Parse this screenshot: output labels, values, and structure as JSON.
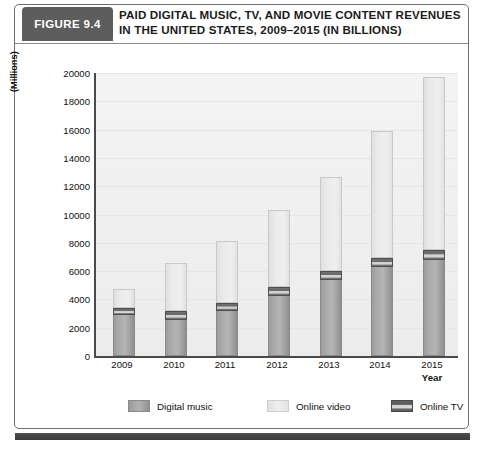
{
  "figure": {
    "tag": "FIGURE 9.4",
    "title_line1": "PAID DIGITAL MUSIC, TV, AND MOVIE CONTENT REVENUES",
    "title_line2": "IN THE UNITED STATES, 2009–2015 (IN BILLIONS)"
  },
  "chart_data": {
    "type": "bar",
    "subtype": "stacked-vertical",
    "title": "PAID DIGITAL MUSIC, TV, AND MOVIE CONTENT REVENUES IN THE UNITED STATES, 2009–2015 (IN BILLIONS)",
    "xlabel": "Year",
    "ylabel": "(Millions)",
    "ylim": [
      0,
      20000
    ],
    "ytick_step": 2000,
    "yticks": [
      "20000",
      "18000",
      "16000",
      "14000",
      "12000",
      "10000",
      "8000",
      "6000",
      "4000",
      "2000",
      "0"
    ],
    "categories": [
      "2009",
      "2010",
      "2011",
      "2012",
      "2013",
      "2014",
      "2015"
    ],
    "grid": true,
    "legend_position": "bottom",
    "series": [
      {
        "name": "Digital music",
        "color": "#a9a9a9",
        "values": [
          2900,
          2550,
          3150,
          4250,
          5350,
          6300,
          6800
        ]
      },
      {
        "name": "Online TV",
        "color": "#6a6a6a",
        "values": [
          500,
          600,
          600,
          600,
          650,
          650,
          700
        ]
      },
      {
        "name": "Online video",
        "color": "#eaeaea",
        "values": [
          1350,
          3450,
          4400,
          5500,
          6650,
          8950,
          12200
        ]
      }
    ],
    "totals": [
      4750,
      6600,
      8150,
      10350,
      12650,
      15900,
      19700
    ]
  },
  "legend": {
    "items": [
      {
        "label": "Digital music",
        "swatch": "swatch-digital-music"
      },
      {
        "label": "Online  video",
        "swatch": "swatch-online-video"
      },
      {
        "label": "Online TV",
        "swatch": "swatch-online-tv"
      }
    ]
  },
  "colors": {
    "tag_bg": "#5d5d5d",
    "plot_bg": "#f2f2f2",
    "axis": "#4a4a4a",
    "bottom_rule": "#4f4f4f"
  }
}
